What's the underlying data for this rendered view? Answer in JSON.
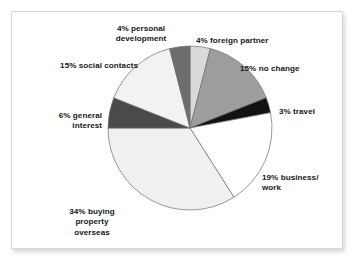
{
  "figure": {
    "background_color": "#ffffff",
    "frame_border_color": "#d8d8d8"
  },
  "chart_data": {
    "type": "pie",
    "title": "",
    "subtitle": "",
    "xlabel": "",
    "ylabel": "",
    "legend_position": "none",
    "grid": false,
    "units": "percent",
    "total": 100,
    "start_angle_deg": -90,
    "direction": "clockwise",
    "center": {
      "x": 190,
      "y": 128
    },
    "radius": 82,
    "outline_color": "#6e6e6e",
    "categories": [
      "foreign partner",
      "no change",
      "travel",
      "business/work",
      "buying property overseas",
      "general interest",
      "social contacts",
      "personal development"
    ],
    "values": [
      4,
      15,
      3,
      19,
      34,
      6,
      15,
      4
    ],
    "colors": [
      "#d9d9d9",
      "#9d9d9d",
      "#121212",
      "#ffffff",
      "#f0f0f0",
      "#4a4a4a",
      "#f2f2f2",
      "#6d6d6d"
    ],
    "labels": [
      "4% foreign partner",
      "15% no change",
      "3% travel",
      "19% business/\nwork",
      "34% buying\nproperty\noverseas",
      "6% general\ninterest",
      "15% social contacts",
      "4% personal\ndevelopment"
    ]
  },
  "labels": {
    "personal_development": "4% personal\ndevelopment",
    "foreign_partner": "4% foreign partner",
    "no_change": "15% no change",
    "travel": "3% travel",
    "business_work": "19% business/\nwork",
    "buying_property": "34% buying\nproperty\noverseas",
    "general_interest": "6% general\ninterest",
    "social_contacts": "15% social contacts"
  }
}
